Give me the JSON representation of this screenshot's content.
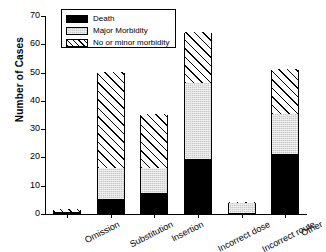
{
  "chart_data": {
    "type": "bar",
    "subtype": "stacked",
    "title": "",
    "xlabel": "",
    "ylabel": "Number of Cases",
    "ylim": [
      0,
      70
    ],
    "yticks": [
      0,
      10,
      20,
      30,
      40,
      50,
      60,
      70
    ],
    "grid": false,
    "legend_position": "top-left-inside",
    "categories": [
      "Omission",
      "Substitution",
      "Insertion",
      "Incorrect dose",
      "Incorrect route",
      "Other"
    ],
    "series": [
      {
        "name": "Death",
        "values": [
          0.5,
          5,
          7,
          19,
          0,
          21
        ]
      },
      {
        "name": "Major Morbidity",
        "values": [
          0,
          11,
          9,
          27,
          3.5,
          14
        ]
      },
      {
        "name": "No or minor morbidity",
        "values": [
          1,
          34,
          19,
          18,
          0.5,
          16
        ]
      }
    ],
    "totals": [
      1.5,
      50,
      35,
      64,
      4,
      51
    ]
  },
  "legend": {
    "items": [
      {
        "label": "Death",
        "swatch": "solid-black"
      },
      {
        "label": "Major Morbidity",
        "swatch": "gray-stipple"
      },
      {
        "label": "No or minor morbidity",
        "swatch": "diagonal-hatch"
      }
    ]
  }
}
